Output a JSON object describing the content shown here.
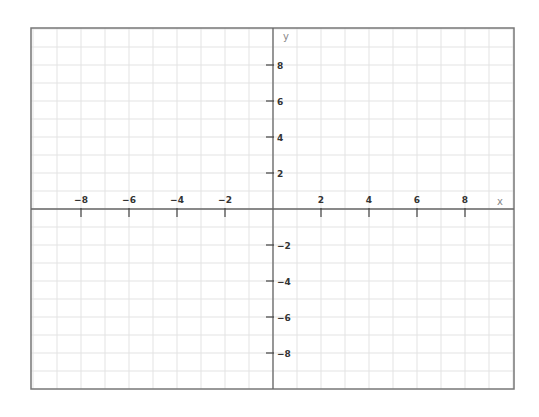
{
  "chart_data": {
    "type": "line",
    "title": "",
    "xlabel": "x",
    "ylabel": "y",
    "xlim": [
      -10,
      10
    ],
    "ylim": [
      -10,
      10
    ],
    "grid": true,
    "grid_step": 1,
    "series": [],
    "x_ticks": [
      -8,
      -6,
      -4,
      -2,
      2,
      4,
      6,
      8
    ],
    "y_ticks": [
      8,
      6,
      4,
      2,
      -2,
      -4,
      -6,
      -8
    ],
    "x_tick_labels": [
      "−8",
      "−6",
      "−4",
      "−2",
      "2",
      "4",
      "6",
      "8"
    ],
    "y_tick_labels": [
      "8",
      "6",
      "4",
      "2",
      "−2",
      "−4",
      "−6",
      "−8"
    ]
  },
  "colors": {
    "grid": "#e3e3e3",
    "axis": "#666666",
    "frame": "#777777",
    "tick_text": "#333333",
    "axis_label": "#888888"
  }
}
